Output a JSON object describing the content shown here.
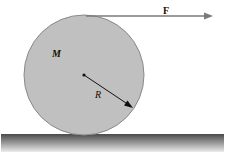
{
  "diagram": {
    "labels": {
      "mass": "M",
      "radius": "R",
      "force": "F"
    },
    "colors": {
      "disk_fill": "#c0c0c0",
      "disk_stroke": "#8a8a8a",
      "arrow": "#7a7a7a",
      "ground_top": "#4a4a4a",
      "ground_bottom": "#e6e6e6"
    }
  }
}
